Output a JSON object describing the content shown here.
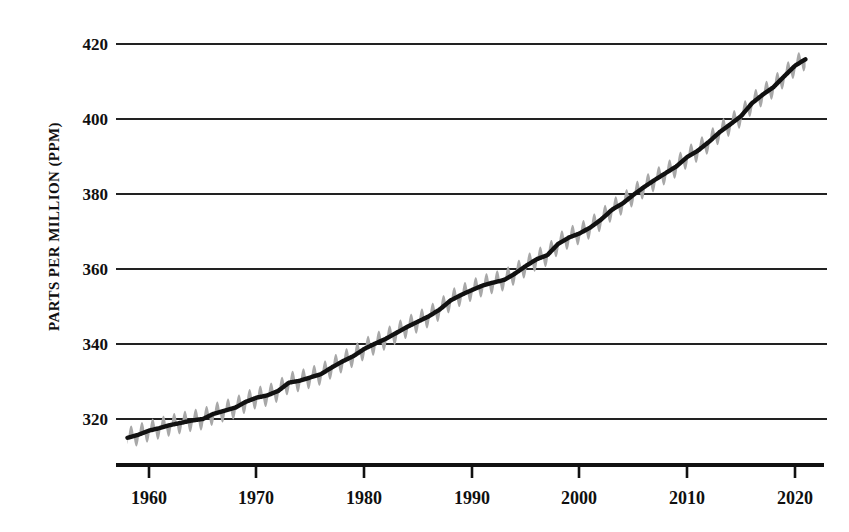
{
  "chart_data": {
    "type": "line",
    "title": "",
    "subtitle": "",
    "xlabel": "",
    "ylabel": "PARTS PER MILLION (PPM)",
    "xlim": [
      1957.5,
      2022.0
    ],
    "ylim": [
      311.0,
      421.5
    ],
    "grid": true,
    "grid_axis": "y",
    "legend": "none",
    "x_ticks": [
      1960,
      1970,
      1980,
      1990,
      2000,
      2010,
      2020
    ],
    "x_tick_labels": [
      "1960",
      "1970",
      "1980",
      "1990",
      "2000",
      "2010",
      "2020"
    ],
    "y_ticks": [
      320,
      340,
      360,
      380,
      400,
      420
    ],
    "y_tick_labels": [
      "320",
      "340",
      "360",
      "380",
      "400",
      "420"
    ],
    "colors": {
      "trend_line": "#111111",
      "seasonal_band": "#a8a8a8",
      "gridline": "#222222",
      "axis": "#111111",
      "background": "#ffffff",
      "text": "#101010"
    },
    "series": [
      {
        "name": "Monthly mean CO2 (seasonal oscillation)",
        "style": "sawtooth-oscillation",
        "color": "#a8a8a8",
        "amplitude_ppm": 3.0,
        "period_years": 1.0,
        "peak_month": 5,
        "trough_month": 9.5
      },
      {
        "name": "Smoothed annual trend",
        "style": "solid-thick",
        "color": "#111111",
        "x": [
          1958,
          1959,
          1960,
          1961,
          1962,
          1963,
          1964,
          1965,
          1966,
          1967,
          1968,
          1969,
          1970,
          1971,
          1972,
          1973,
          1974,
          1975,
          1976,
          1977,
          1978,
          1979,
          1980,
          1981,
          1982,
          1983,
          1984,
          1985,
          1986,
          1987,
          1988,
          1989,
          1990,
          1991,
          1992,
          1993,
          1994,
          1995,
          1996,
          1997,
          1998,
          1999,
          2000,
          2001,
          2002,
          2003,
          2004,
          2005,
          2006,
          2007,
          2008,
          2009,
          2010,
          2011,
          2012,
          2013,
          2014,
          2015,
          2016,
          2017,
          2018,
          2019,
          2020,
          2021
        ],
        "values": [
          315.0,
          315.8,
          316.9,
          317.6,
          318.4,
          319.0,
          319.6,
          320.0,
          321.4,
          322.2,
          323.0,
          324.6,
          325.7,
          326.3,
          327.5,
          329.7,
          330.2,
          331.1,
          332.0,
          333.8,
          335.4,
          336.8,
          338.7,
          340.1,
          341.4,
          343.0,
          344.6,
          346.0,
          347.4,
          349.2,
          351.6,
          353.1,
          354.4,
          355.6,
          356.4,
          357.1,
          358.8,
          360.8,
          362.6,
          363.7,
          366.7,
          368.4,
          369.5,
          371.1,
          373.2,
          375.8,
          377.5,
          379.8,
          381.9,
          383.8,
          385.6,
          387.4,
          389.9,
          391.6,
          393.9,
          396.5,
          398.6,
          400.8,
          404.2,
          406.5,
          408.5,
          411.4,
          414.2,
          416.0
        ]
      }
    ],
    "notes": {
      "data_start_year": 1958,
      "data_end_year": 2021,
      "start_value_ppm": 315.0,
      "end_value_ppm": 416.0,
      "total_increase_ppm": 101.0
    }
  },
  "axes": {
    "y_title": "PARTS PER MILLION (PPM)",
    "y_tick_0": "320",
    "y_tick_1": "340",
    "y_tick_2": "360",
    "y_tick_3": "380",
    "y_tick_4": "400",
    "y_tick_5": "420",
    "x_tick_0": "1960",
    "x_tick_1": "1970",
    "x_tick_2": "1980",
    "x_tick_3": "1990",
    "x_tick_4": "2000",
    "x_tick_5": "2010",
    "x_tick_6": "2020"
  }
}
